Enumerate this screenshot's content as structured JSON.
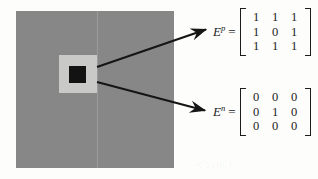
{
  "figure": {
    "type": "diagram",
    "image_panel": {
      "outer_region_name": "background-region",
      "outer_color": "#878787",
      "mid_block_name": "mid-gray-block",
      "mid_color": "#c9c9c7",
      "inner_block_name": "black-center-block",
      "inner_color": "#131313",
      "seam_note": "faint vertical scan seam"
    },
    "arrows": [
      {
        "name": "arrow-to-ep",
        "from": [
          97,
          67
        ],
        "to": [
          209,
          28
        ],
        "target": "E^p"
      },
      {
        "name": "arrow-to-en",
        "from": [
          97,
          82
        ],
        "to": [
          208,
          112
        ],
        "target": "E^n"
      }
    ],
    "equations": [
      {
        "id": "ep",
        "symbol": "E",
        "superscript": "p",
        "equals": "=",
        "matrix": [
          [
            "1",
            "1",
            "1"
          ],
          [
            "1",
            "0",
            "1"
          ],
          [
            "1",
            "1",
            "1"
          ]
        ]
      },
      {
        "id": "en",
        "symbol": "E",
        "superscript": "n",
        "equals": "=",
        "matrix": [
          [
            "0",
            "0",
            "0"
          ],
          [
            "0",
            "1",
            "0"
          ],
          [
            "0",
            "0",
            "0"
          ]
        ]
      }
    ],
    "bleed_through_text": "Curve S"
  }
}
